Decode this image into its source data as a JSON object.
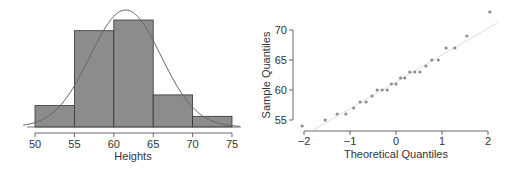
{
  "chart_data": [
    {
      "type": "bar",
      "subtype": "histogram_with_normal_curve",
      "title": "",
      "xlabel": "Heights",
      "ylabel": "",
      "bins": [
        [
          50,
          55
        ],
        [
          55,
          60
        ],
        [
          60,
          65
        ],
        [
          65,
          70
        ],
        [
          70,
          75
        ]
      ],
      "categories": [
        "50-55",
        "55-60",
        "60-65",
        "65-70",
        "70-75"
      ],
      "values": [
        2,
        9,
        10,
        3,
        1
      ],
      "x_ticks": [
        "50",
        "55",
        "60",
        "65",
        "70",
        "75"
      ],
      "xlim": [
        50,
        75
      ],
      "normal_curve": {
        "mean": 61.5,
        "sd": 4.5
      },
      "grid": false,
      "colors": {
        "bar": "#8c8c8c",
        "bar_edge": "#333333",
        "curve": "#666666"
      }
    },
    {
      "type": "scatter",
      "subtype": "normal_qq_plot",
      "title": "",
      "xlabel": "Theoretical Quantiles",
      "ylabel": "Sample Quantiles",
      "x_ticks": [
        "−2",
        "−1",
        "0",
        "1",
        "2"
      ],
      "y_ticks": [
        "55",
        "60",
        "65",
        "70"
      ],
      "xlim": [
        -2.1,
        2.1
      ],
      "ylim": [
        53.5,
        73.5
      ],
      "points": [
        [
          -2.04,
          54
        ],
        [
          -1.54,
          55
        ],
        [
          -1.28,
          56
        ],
        [
          -1.09,
          56
        ],
        [
          -0.92,
          57
        ],
        [
          -0.78,
          58
        ],
        [
          -0.65,
          58
        ],
        [
          -0.52,
          59
        ],
        [
          -0.41,
          60
        ],
        [
          -0.3,
          60
        ],
        [
          -0.19,
          60
        ],
        [
          -0.1,
          61
        ],
        [
          0.0,
          61
        ],
        [
          0.1,
          62
        ],
        [
          0.19,
          62
        ],
        [
          0.3,
          63
        ],
        [
          0.41,
          63
        ],
        [
          0.52,
          63
        ],
        [
          0.65,
          64
        ],
        [
          0.78,
          65
        ],
        [
          0.92,
          65
        ],
        [
          1.09,
          67
        ],
        [
          1.28,
          67
        ],
        [
          1.54,
          69
        ],
        [
          2.04,
          73
        ]
      ],
      "reference_line": {
        "from": [
          -1.8,
          53.3
        ],
        "to": [
          2.2,
          71.2
        ]
      },
      "grid": false,
      "colors": {
        "point": "#8c8c8c",
        "line": "#dddddd"
      }
    }
  ],
  "left_chart": {
    "xlabel": "Heights",
    "ticks": [
      "50",
      "55",
      "60",
      "65",
      "70",
      "75"
    ]
  },
  "right_chart": {
    "xlabel": "Theoretical Quantiles",
    "ylabel": "Sample Quantiles",
    "x_ticks": [
      "−2",
      "−1",
      "0",
      "1",
      "2"
    ],
    "y_ticks": [
      "55",
      "60",
      "65",
      "70"
    ]
  }
}
